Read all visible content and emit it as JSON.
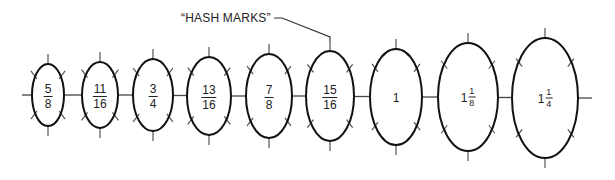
{
  "annotation": {
    "text": "“HASH MARKS”",
    "target_index": 5
  },
  "colors": {
    "outline": "#111111",
    "hash_mark": "#555555",
    "text": "#222222",
    "background": "#ffffff"
  },
  "ellipses": [
    {
      "label_type": "fraction",
      "whole": "",
      "numerator": "5",
      "denominator": "8",
      "cx": 48,
      "cy": 95,
      "rx": 16,
      "ry": 31
    },
    {
      "label_type": "fraction",
      "whole": "",
      "numerator": "11",
      "denominator": "16",
      "cx": 100,
      "cy": 95,
      "rx": 18,
      "ry": 33
    },
    {
      "label_type": "fraction",
      "whole": "",
      "numerator": "3",
      "denominator": "4",
      "cx": 153,
      "cy": 95,
      "rx": 20,
      "ry": 36
    },
    {
      "label_type": "fraction",
      "whole": "",
      "numerator": "13",
      "denominator": "16",
      "cx": 209,
      "cy": 96,
      "rx": 22,
      "ry": 39
    },
    {
      "label_type": "fraction",
      "whole": "",
      "numerator": "7",
      "denominator": "8",
      "cx": 269,
      "cy": 96,
      "rx": 23,
      "ry": 42
    },
    {
      "label_type": "fraction",
      "whole": "",
      "numerator": "15",
      "denominator": "16",
      "cx": 330,
      "cy": 96,
      "rx": 24,
      "ry": 45
    },
    {
      "label_type": "whole",
      "whole": "1",
      "numerator": "",
      "denominator": "",
      "cx": 396,
      "cy": 97,
      "rx": 26,
      "ry": 48
    },
    {
      "label_type": "mixed",
      "whole": "1",
      "numerator": "1",
      "denominator": "8",
      "cx": 468,
      "cy": 97,
      "rx": 30,
      "ry": 54
    },
    {
      "label_type": "mixed",
      "whole": "1",
      "numerator": "1",
      "denominator": "4",
      "cx": 545,
      "cy": 98,
      "rx": 33,
      "ry": 60
    }
  ],
  "stubs": {
    "left": {
      "x1": 22,
      "x2": 32,
      "y": 95
    },
    "right": {
      "x1": 578,
      "x2": 592,
      "y": 98
    }
  }
}
